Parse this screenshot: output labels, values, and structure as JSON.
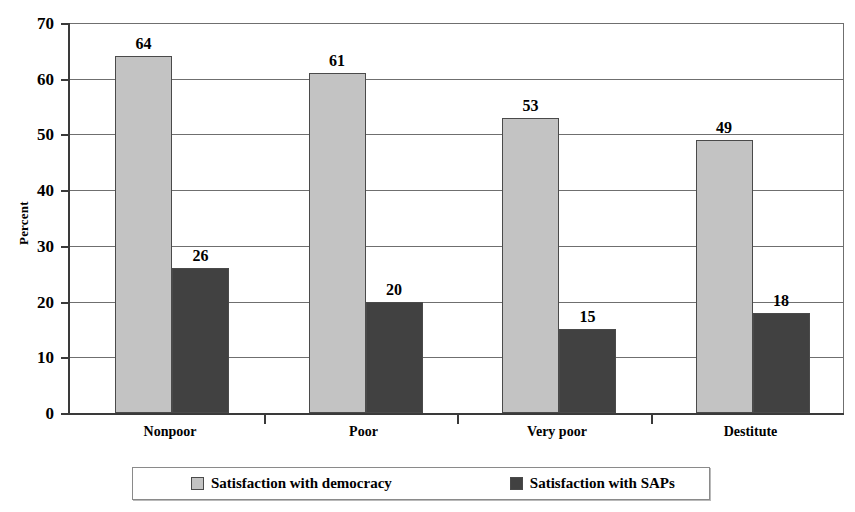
{
  "chart_data": {
    "type": "bar",
    "title": "",
    "subtitle": "",
    "xlabel": "",
    "ylabel": "Percent",
    "ylim": [
      0,
      70
    ],
    "ytick_values": [
      0,
      10,
      20,
      30,
      40,
      50,
      60,
      70
    ],
    "ytick_labels": [
      "0",
      "10",
      "20",
      "30",
      "40",
      "50",
      "60",
      "70"
    ],
    "grid": true,
    "grid_axis": "y",
    "legend_position": "bottom",
    "categories": [
      "Nonpoor",
      "Poor",
      "Very poor",
      "Destitute"
    ],
    "series": [
      {
        "name": "Satisfaction with democracy",
        "color": "#c3c3c3",
        "values": [
          64,
          61,
          53,
          49
        ],
        "labels": [
          "64",
          "61",
          "53",
          "49"
        ]
      },
      {
        "name": "Satisfaction with SAPs",
        "color": "#414141",
        "values": [
          26,
          20,
          15,
          18
        ],
        "labels": [
          "26",
          "20",
          "15",
          "18"
        ]
      }
    ]
  }
}
